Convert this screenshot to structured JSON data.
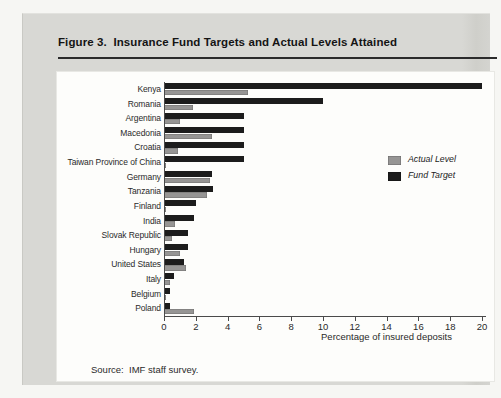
{
  "figure": {
    "title": "Figure 3.  Insurance Fund Targets and Actual Levels Attained",
    "source_note": "Source:  IMF staff survey."
  },
  "chart_data": {
    "type": "bar",
    "orientation": "horizontal",
    "title": "Figure 3. Insurance Fund Targets and Actual Levels Attained",
    "categories": [
      "Kenya",
      "Romania",
      "Argentina",
      "Macedonia",
      "Croatia",
      "Taiwan Province of China",
      "Germany",
      "Tanzania",
      "Finland",
      "India",
      "Slovak Republic",
      "Hungary",
      "United States",
      "Italy",
      "Belgium",
      "Poland"
    ],
    "series": [
      {
        "name": "Fund Target",
        "color": "#1c1c1c",
        "values": [
          20,
          10,
          5,
          5,
          5,
          5,
          3,
          3.1,
          2,
          1.9,
          1.5,
          1.5,
          1.25,
          0.6,
          0.4,
          0.35
        ]
      },
      {
        "name": "Actual Level",
        "color": "#969594",
        "values": [
          5.3,
          1.8,
          1.0,
          3.0,
          0.85,
          0.1,
          2.9,
          2.7,
          0.1,
          0.7,
          0.5,
          1.0,
          1.4,
          0.4,
          0.1,
          1.9
        ]
      }
    ],
    "xlabel": "Percentage of insured deposits",
    "xlim": [
      0,
      20
    ],
    "xticks": [
      0,
      2,
      4,
      6,
      8,
      10,
      12,
      14,
      16,
      18,
      20
    ],
    "grid": false,
    "legend": {
      "position": "right-middle",
      "items": [
        {
          "label": "Actual Level",
          "color": "#969594"
        },
        {
          "label": "Fund Target",
          "color": "#1c1c1c"
        }
      ]
    }
  }
}
